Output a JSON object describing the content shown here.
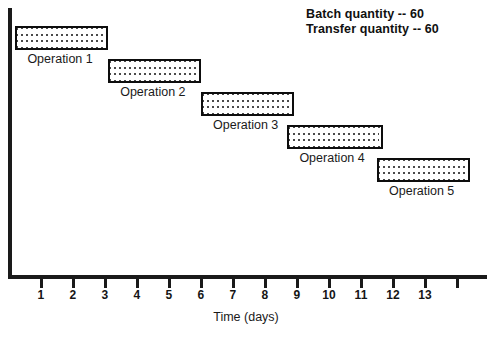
{
  "legend": {
    "batch": "Batch quantity -- 60",
    "transfer": "Transfer quantity -- 60"
  },
  "axis": {
    "title": "Time (days)"
  },
  "chart_data": {
    "type": "bar",
    "orientation": "horizontal",
    "title": "",
    "xlabel": "Time (days)",
    "ylabel": "",
    "xlim": [
      0,
      14.9
    ],
    "grid": false,
    "legend_position": "top-right",
    "tick_labels": [
      "1",
      "2",
      "3",
      "4",
      "5",
      "6",
      "7",
      "8",
      "9",
      "10",
      "11",
      "12",
      "13"
    ],
    "tick_values": [
      1,
      2,
      3,
      4,
      5,
      6,
      7,
      8,
      9,
      10,
      11,
      12,
      13
    ],
    "unlabeled_ticks": [
      14
    ],
    "annotations": [
      "Batch quantity -- 60",
      "Transfer quantity -- 60"
    ],
    "categories": [
      "Operation 1",
      "Operation 2",
      "Operation 3",
      "Operation 4",
      "Operation 5"
    ],
    "bars": [
      {
        "label": "Operation 1",
        "start": 0.2,
        "end": 3.1,
        "duration": 2.9,
        "row": 0
      },
      {
        "label": "Operation 2",
        "start": 3.1,
        "end": 6.0,
        "duration": 2.9,
        "row": 1
      },
      {
        "label": "Operation 3",
        "start": 6.0,
        "end": 8.9,
        "duration": 2.9,
        "row": 2
      },
      {
        "label": "Operation 4",
        "start": 8.7,
        "end": 11.7,
        "duration": 3.0,
        "row": 3
      },
      {
        "label": "Operation 5",
        "start": 11.5,
        "end": 14.4,
        "duration": 2.9,
        "row": 4
      }
    ]
  },
  "colors": {
    "ink": "#0d0d0d",
    "background": "#ffffff",
    "bar_fill": "#4a4a4a"
  }
}
